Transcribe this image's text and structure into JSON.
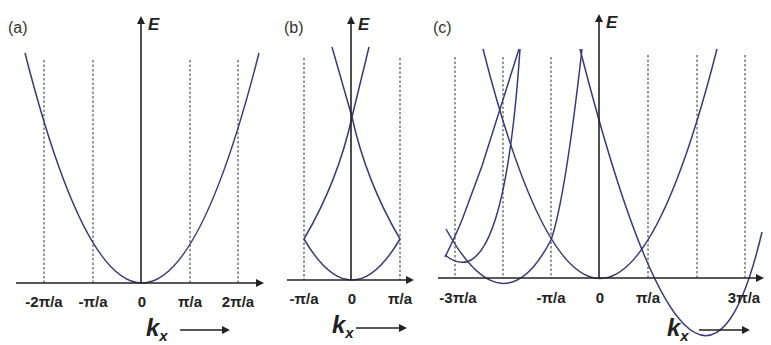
{
  "figure": {
    "curve_color": "#3b3a78",
    "axis_color": "#222222"
  },
  "panels": [
    {
      "id": "a",
      "label": "(a)",
      "y_axis_label": "E",
      "x_axis_label": "k",
      "x_axis_sub": "x",
      "tick_labels": [
        "-2π/a",
        "-π/a",
        "0",
        "π/a",
        "2π/a"
      ],
      "scheme": "extended zone"
    },
    {
      "id": "b",
      "label": "(b)",
      "y_axis_label": "E",
      "x_axis_label": "k",
      "x_axis_sub": "x",
      "tick_labels": [
        "-π/a",
        "0",
        "π/a"
      ],
      "scheme": "reduced zone"
    },
    {
      "id": "c",
      "label": "(c)",
      "y_axis_label": "E",
      "x_axis_label": "k",
      "x_axis_sub": "x",
      "tick_labels": [
        "-3π/a",
        "-π/a",
        "0",
        "π/a",
        "3π/a"
      ],
      "scheme": "periodic zone"
    }
  ],
  "arrow_glyph": "⟶"
}
